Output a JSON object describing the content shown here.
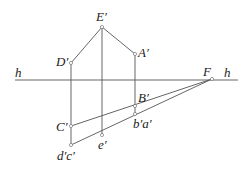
{
  "diagram": {
    "type": "perspective-projection",
    "horizon_line": {
      "label_left": "h",
      "label_right": "h",
      "y": 80,
      "x1": 15,
      "x2": 238
    },
    "vanishing_point": {
      "label": "F",
      "x": 212,
      "y": 79
    },
    "points": {
      "E": {
        "label": "E′",
        "x": 102,
        "y": 27
      },
      "D": {
        "label": "D′",
        "x": 71,
        "y": 63
      },
      "A": {
        "label": "A′",
        "x": 135,
        "y": 54
      },
      "C": {
        "label": "C′",
        "x": 71,
        "y": 126
      },
      "dc": {
        "label": "d′c′",
        "x": 71,
        "y": 145
      },
      "e": {
        "label": "e′",
        "x": 102,
        "y": 135
      },
      "B": {
        "label": "B′",
        "x": 135,
        "y": 106
      },
      "ba": {
        "label": "b′a′",
        "x": 135,
        "y": 114
      }
    }
  }
}
